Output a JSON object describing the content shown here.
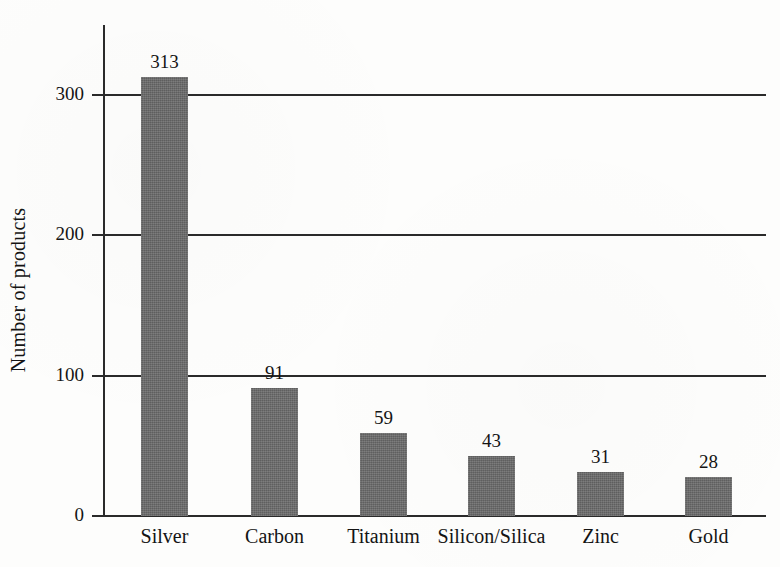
{
  "chart_data": {
    "type": "bar",
    "title": "",
    "subtitle": "",
    "xlabel": "",
    "ylabel": "Number of products",
    "categories": [
      "Silver",
      "Carbon",
      "Titanium",
      "Silicon/Silica",
      "Zinc",
      "Gold"
    ],
    "values": [
      313,
      91,
      59,
      43,
      31,
      28
    ],
    "value_labels": [
      "313",
      "91",
      "59",
      "43",
      "31",
      "28"
    ],
    "ylim": [
      0,
      340
    ],
    "yticks": [
      0,
      100,
      200,
      300
    ],
    "ytick_labels": [
      "0",
      "100",
      "200",
      "300"
    ],
    "grid": "horizontal",
    "legend": "none",
    "bar_color": "#6a6a6a",
    "axis_color": "#2a2a2a",
    "background_color": "#fdfdfc",
    "text_color": "#141414"
  },
  "axis": {
    "y_title": "Number of products",
    "ticks": [
      {
        "label": "300",
        "value": 300
      },
      {
        "label": "200",
        "value": 200
      },
      {
        "label": "100",
        "value": 100
      },
      {
        "label": "0",
        "value": 0
      }
    ]
  },
  "bars": [
    {
      "category": "Silver",
      "value": 313,
      "label": "313"
    },
    {
      "category": "Carbon",
      "value": 91,
      "label": "91"
    },
    {
      "category": "Titanium",
      "value": 59,
      "label": "59"
    },
    {
      "category": "Silicon/Silica",
      "value": 43,
      "label": "43"
    },
    {
      "category": "Zinc",
      "value": 31,
      "label": "31"
    },
    {
      "category": "Gold",
      "value": 28,
      "label": "28"
    }
  ]
}
